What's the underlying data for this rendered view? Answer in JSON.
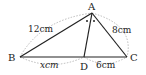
{
  "diagram": {
    "type": "triangle-angle-bisector",
    "points": {
      "A": {
        "label": "A",
        "x": 92,
        "y": 13
      },
      "B": {
        "label": "B",
        "x": 20,
        "y": 57
      },
      "C": {
        "label": "C",
        "x": 127,
        "y": 57
      },
      "D": {
        "label": "D",
        "x": 84,
        "y": 57
      }
    },
    "side_labels": {
      "AB": "12cm",
      "AC": "8cm",
      "BD": "xcm",
      "DC": "6cm"
    },
    "angle_marks": "•",
    "stroke_color": "#222222",
    "dotted_color": "#aaaaaa"
  }
}
